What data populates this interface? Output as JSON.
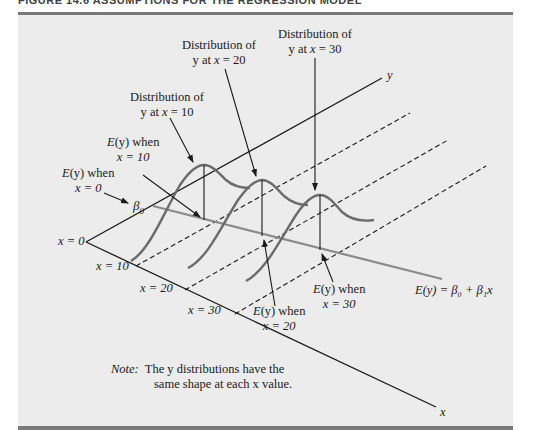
{
  "header": {
    "title": "FIGURE 14.6   ASSUMPTIONS FOR THE REGRESSION MODEL"
  },
  "axes": {
    "y_label": "y",
    "x_label": "x",
    "x_ticks": [
      "x = 0",
      "x = 10",
      "x = 20",
      "x = 30"
    ]
  },
  "labels": {
    "dist_x10": {
      "line1": "Distribution of",
      "line2_pre": "y at ",
      "line2_var": "x",
      "line2_post": " = 10"
    },
    "dist_x20": {
      "line1": "Distribution of",
      "line2_pre": "y at ",
      "line2_var": "x",
      "line2_post": " = 20"
    },
    "dist_x30": {
      "line1": "Distribution of",
      "line2_pre": "y at ",
      "line2_var": "x",
      "line2_post": " = 30"
    },
    "ey_x0": {
      "line1_fn": "E",
      "line1_arg": "(y)",
      "line1_post": " when",
      "line2": "x = 0"
    },
    "ey_x10": {
      "line1_fn": "E",
      "line1_arg": "(y)",
      "line1_post": " when",
      "line2": "x = 10"
    },
    "ey_x20": {
      "line1_fn": "E",
      "line1_arg": "(y)",
      "line1_post": " when",
      "line2": "x = 20"
    },
    "ey_x30": {
      "line1_fn": "E",
      "line1_arg": "(y)",
      "line1_post": " when",
      "line2": "x = 30"
    },
    "beta0": "β",
    "beta0_sub": "0",
    "regression_eq": "E(y) = β₀ + β₁x"
  },
  "note": {
    "prefix": "Note:",
    "line1": "The y distributions have the",
    "line2": "same shape at each x value."
  },
  "colors": {
    "panel": "#ececec",
    "rule": "#7a7a7a",
    "axis": "#1a1a1a",
    "curve": "#6b6b6b",
    "regression": "#8a8a8a"
  }
}
